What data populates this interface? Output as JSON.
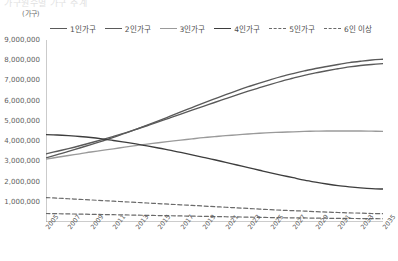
{
  "title": "가구원수별 가구 추계",
  "y_unit": "(가구)",
  "legend": [
    {
      "label": "1인가구",
      "style": "solid",
      "color": "#5a5a5a"
    },
    {
      "label": "2인가구",
      "style": "solid",
      "color": "#5a5a5a"
    },
    {
      "label": "3인가구",
      "style": "solid",
      "color": "#9a9a9a"
    },
    {
      "label": "4인가구",
      "style": "solid",
      "color": "#3d3d3d"
    },
    {
      "label": "5인가구",
      "style": "dashed",
      "color": "#6a6a6a"
    },
    {
      "label": "6인 이상",
      "style": "dashed",
      "color": "#6a6a6a"
    }
  ],
  "chart_data": {
    "type": "line",
    "title": "가구원수별 가구 추계",
    "xlabel": "",
    "ylabel": "(가구)",
    "ylim": [
      0,
      9000000
    ],
    "ytick_labels": [
      "9,000,000",
      "8,000,000",
      "7,000,000",
      "6,000,000",
      "5,000,000",
      "4,000,000",
      "3,000,000",
      "2,000,000",
      "1,000,000"
    ],
    "ytick_values": [
      9000000,
      8000000,
      7000000,
      6000000,
      5000000,
      4000000,
      3000000,
      2000000,
      1000000
    ],
    "grid": false,
    "legend_position": "top",
    "x": [
      2005,
      2006,
      2007,
      2008,
      2009,
      2010,
      2011,
      2012,
      2013,
      2014,
      2015,
      2016,
      2017,
      2018,
      2019,
      2020,
      2021,
      2022,
      2023,
      2024,
      2025,
      2026,
      2027,
      2028,
      2029,
      2030,
      2031,
      2032,
      2033,
      2034,
      2035
    ],
    "xtick_labels": [
      "2005",
      "2007",
      "2009",
      "2011",
      "2013",
      "2015",
      "2017",
      "2019",
      "2021",
      "2023",
      "2025",
      "2027",
      "2029",
      "2031",
      "2033",
      "2035"
    ],
    "series": [
      {
        "name": "1인가구",
        "style": "solid",
        "color": "#5a5a5a",
        "values": [
          3170000,
          3330000,
          3490000,
          3660000,
          3830000,
          4000000,
          4180000,
          4380000,
          4580000,
          4790000,
          5000000,
          5220000,
          5440000,
          5660000,
          5880000,
          6090000,
          6300000,
          6500000,
          6690000,
          6870000,
          7040000,
          7200000,
          7340000,
          7470000,
          7590000,
          7690000,
          7790000,
          7880000,
          7950000,
          8010000,
          8050000
        ]
      },
      {
        "name": "2인가구",
        "style": "solid",
        "color": "#5a5a5a",
        "values": [
          3370000,
          3500000,
          3630000,
          3770000,
          3920000,
          4070000,
          4230000,
          4400000,
          4580000,
          4760000,
          4950000,
          5140000,
          5330000,
          5530000,
          5720000,
          5910000,
          6100000,
          6290000,
          6470000,
          6640000,
          6810000,
          6970000,
          7110000,
          7250000,
          7370000,
          7480000,
          7580000,
          7670000,
          7740000,
          7790000,
          7830000
        ]
      },
      {
        "name": "3인가구",
        "style": "solid",
        "color": "#9a9a9a",
        "values": [
          3110000,
          3200000,
          3290000,
          3370000,
          3460000,
          3540000,
          3620000,
          3700000,
          3780000,
          3850000,
          3920000,
          3990000,
          4050000,
          4110000,
          4170000,
          4220000,
          4270000,
          4310000,
          4350000,
          4390000,
          4420000,
          4440000,
          4460000,
          4480000,
          4490000,
          4500000,
          4500000,
          4500000,
          4500000,
          4490000,
          4480000
        ]
      },
      {
        "name": "4인가구",
        "style": "solid",
        "color": "#3d3d3d",
        "values": [
          4320000,
          4300000,
          4270000,
          4230000,
          4180000,
          4110000,
          4030000,
          3950000,
          3860000,
          3760000,
          3660000,
          3550000,
          3440000,
          3320000,
          3200000,
          3080000,
          2950000,
          2820000,
          2690000,
          2560000,
          2430000,
          2310000,
          2190000,
          2070000,
          1970000,
          1880000,
          1800000,
          1740000,
          1690000,
          1650000,
          1630000
        ]
      },
      {
        "name": "5인가구",
        "style": "dashed",
        "color": "#6a6a6a",
        "values": [
          1210000,
          1180000,
          1150000,
          1120000,
          1090000,
          1060000,
          1030000,
          1000000,
          970000,
          940000,
          910000,
          880000,
          850000,
          820000,
          790000,
          760000,
          730000,
          700000,
          670000,
          640000,
          610000,
          580000,
          560000,
          540000,
          510000,
          490000,
          470000,
          450000,
          440000,
          420000,
          410000
        ]
      },
      {
        "name": "6인 이상",
        "style": "dashed",
        "color": "#6a6a6a",
        "values": [
          420000,
          410000,
          400000,
          390000,
          380000,
          370000,
          360000,
          350000,
          340000,
          330000,
          320000,
          310000,
          300000,
          290000,
          280000,
          270000,
          260000,
          250000,
          240000,
          230000,
          220000,
          210000,
          205000,
          200000,
          190000,
          185000,
          180000,
          175000,
          170000,
          165000,
          160000
        ]
      }
    ]
  }
}
